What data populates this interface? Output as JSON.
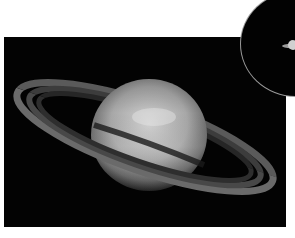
{
  "image": {
    "subject": "Saturn with rings",
    "background_color": "#030303",
    "page_background": "#ffffff"
  },
  "inset": {
    "subject": "small Saturn in circular inset",
    "border_color": "#9a9a9a"
  },
  "caption": {
    "text": ""
  }
}
